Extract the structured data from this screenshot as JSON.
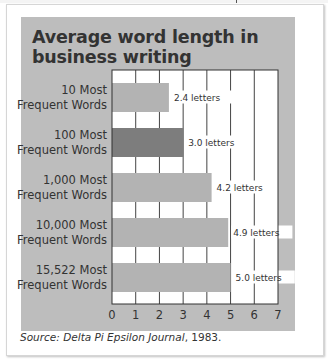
{
  "chart_data": {
    "type": "bar",
    "orientation": "horizontal",
    "title": "Average word length in business writing",
    "categories": [
      [
        "10 Most",
        "Frequent Words"
      ],
      [
        "100 Most",
        "Frequent Words"
      ],
      [
        "1,000 Most",
        "Frequent Words"
      ],
      [
        "10,000 Most",
        "Frequent Words"
      ],
      [
        "15,522 Most",
        "Frequent Words"
      ]
    ],
    "values": [
      2.4,
      3.0,
      4.2,
      4.9,
      5.0
    ],
    "value_labels": [
      "2.4 letters",
      "3.0 letters",
      "4.2 letters",
      "4.9 letters",
      "5.0 letters"
    ],
    "highlight_index": 1,
    "xlabel": "",
    "ylabel": "",
    "xlim": [
      0,
      7
    ],
    "xticks": [
      0,
      1,
      2,
      3,
      4,
      5,
      6,
      7
    ],
    "grid": true,
    "colors": {
      "panel": "#bdbdbd",
      "bar": "#b3b3b3",
      "bar_highlight": "#7d7d7d",
      "plot_bg": "#ffffff",
      "grid": "#444444"
    }
  },
  "source": {
    "prefix": "Source: ",
    "publication": "Delta Pi Epsilon Journal",
    "suffix": ", 1983."
  }
}
